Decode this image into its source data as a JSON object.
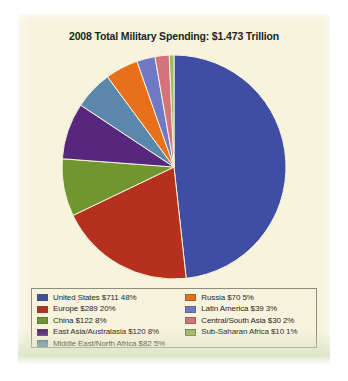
{
  "panel": {
    "background_color": "#f7f3dd",
    "border_color": "#8d8d7e"
  },
  "chart_data": {
    "type": "pie",
    "title": "2008 Total Military Spending: $1.473 Trillion",
    "subtitle": "",
    "xlabel": "",
    "ylabel": "",
    "total_label": "$1.473 Trillion",
    "total_value": 1473,
    "units": "billions of US dollars",
    "legend_position": "bottom",
    "grid": false,
    "start_angle_deg": 0,
    "direction": "clockwise",
    "categories": [
      "United States",
      "Europe",
      "China",
      "East Asia/Australasia",
      "Middle East/North Africa",
      "Russia",
      "Latin America",
      "Central/South Asia",
      "Sub-Saharan Africa"
    ],
    "values": [
      711,
      289,
      122,
      120,
      82,
      70,
      39,
      30,
      10
    ],
    "percents": [
      48,
      20,
      8,
      8,
      5,
      5,
      3,
      2,
      1
    ],
    "colors": [
      "#3f4ea3",
      "#b5301d",
      "#6f962f",
      "#57277e",
      "#5b87ad",
      "#e8701a",
      "#6f79c6",
      "#d4737a",
      "#9dbb63"
    ]
  },
  "legend": {
    "left_column": [
      {
        "label": "United States $711 48%",
        "color": "#3f4ea3",
        "swatch_name": "swatch-united-states"
      },
      {
        "label": "Europe $289 20%",
        "color": "#b5301d",
        "swatch_name": "swatch-europe"
      },
      {
        "label": "China $122 8%",
        "color": "#6f962f",
        "swatch_name": "swatch-china"
      },
      {
        "label": "East Asia/Australasia $120 8%",
        "color": "#57277e",
        "swatch_name": "swatch-east-asia-australasia"
      },
      {
        "label": "Middle East/North Africa $82 5%",
        "color": "#5b87ad",
        "swatch_name": "swatch-middle-east-north-africa"
      }
    ],
    "right_column": [
      {
        "label": "Russia $70 5%",
        "color": "#e8701a",
        "swatch_name": "swatch-russia"
      },
      {
        "label": "Latin America $39 3%",
        "color": "#6f79c6",
        "swatch_name": "swatch-latin-america"
      },
      {
        "label": "Central/South Asia $30 2%",
        "color": "#d4737a",
        "swatch_name": "swatch-central-south-asia"
      },
      {
        "label": "Sub-Saharan Africa $10 1%",
        "color": "#9dbb63",
        "swatch_name": "swatch-sub-saharan-africa"
      }
    ]
  }
}
